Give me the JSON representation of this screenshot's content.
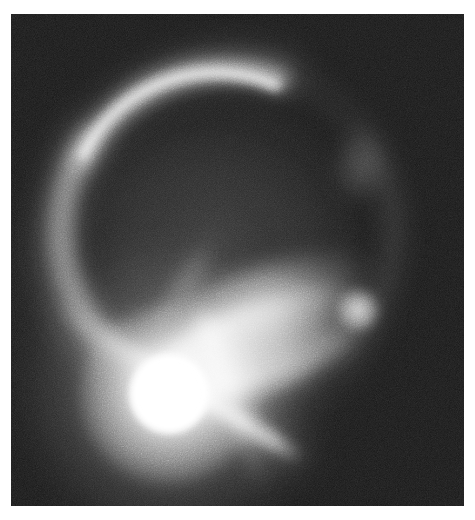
{
  "figure": {
    "kind": "astronomical-image",
    "border_color": "#ffffff",
    "background_color": "#141414",
    "field": {
      "x": 11,
      "y": 14,
      "width": 453,
      "height": 492
    },
    "colormap": "grayscale",
    "noise": "pixel-level detector noise"
  },
  "features": [
    {
      "id": "central-source",
      "label": "Bright central point source",
      "type": "point-source",
      "x": 158,
      "y": 380,
      "saturated_radius_px": 33,
      "halo_radius_px": 90,
      "peak_color": "#ffffff"
    },
    {
      "id": "top-arc",
      "label": "Upper lensed arc",
      "type": "arc",
      "start": {
        "x": 95,
        "y": 138
      },
      "apex": {
        "x": 215,
        "y": 88
      },
      "end": {
        "x": 330,
        "y": 160
      },
      "brightness": "bright",
      "color": "#e8e8e8"
    },
    {
      "id": "left-arc",
      "label": "Left descending arc",
      "type": "arc",
      "start": {
        "x": 92,
        "y": 150
      },
      "end": {
        "x": 150,
        "y": 350
      },
      "brightness": "moderate",
      "color": "#a8a8a8"
    },
    {
      "id": "right-arc",
      "label": "Faint right ring segment",
      "type": "arc",
      "start": {
        "x": 340,
        "y": 160
      },
      "end": {
        "x": 355,
        "y": 280
      },
      "brightness": "faint",
      "color": "#787878"
    },
    {
      "id": "lower-streak",
      "label": "Bright lower-right counter-arc",
      "type": "streak",
      "start": {
        "x": 165,
        "y": 400
      },
      "end": {
        "x": 355,
        "y": 305
      },
      "brightness": "bright",
      "color": "#ececec"
    },
    {
      "id": "upper-streak",
      "label": "Secondary upper-right streak",
      "type": "streak",
      "start": {
        "x": 185,
        "y": 330
      },
      "end": {
        "x": 340,
        "y": 285
      },
      "brightness": "moderate",
      "color": "#bebebe"
    },
    {
      "id": "secondary-blob",
      "label": "Compact secondary source",
      "type": "point-source",
      "x": 347,
      "y": 296,
      "radius_px": 13,
      "brightness": "moderate",
      "color": "#e2e2e2"
    },
    {
      "id": "right-knot",
      "label": "Faint right-side knot",
      "type": "diffuse-knot",
      "x": 350,
      "y": 155,
      "brightness": "very faint",
      "color": "#8c8c8c"
    },
    {
      "id": "spike-down-left",
      "label": "Diffraction spike (down-left)",
      "type": "diffraction-spike",
      "angle_deg": 32,
      "brightness": "moderate"
    },
    {
      "id": "spike-down-right",
      "label": "Diffraction spike (down-right)",
      "type": "diffraction-spike",
      "angle_deg": 70,
      "brightness": "moderate"
    },
    {
      "id": "spike-up-left",
      "label": "Diffraction spike (up-left)",
      "type": "diffraction-spike",
      "angle_deg": -58,
      "brightness": "faint"
    }
  ]
}
